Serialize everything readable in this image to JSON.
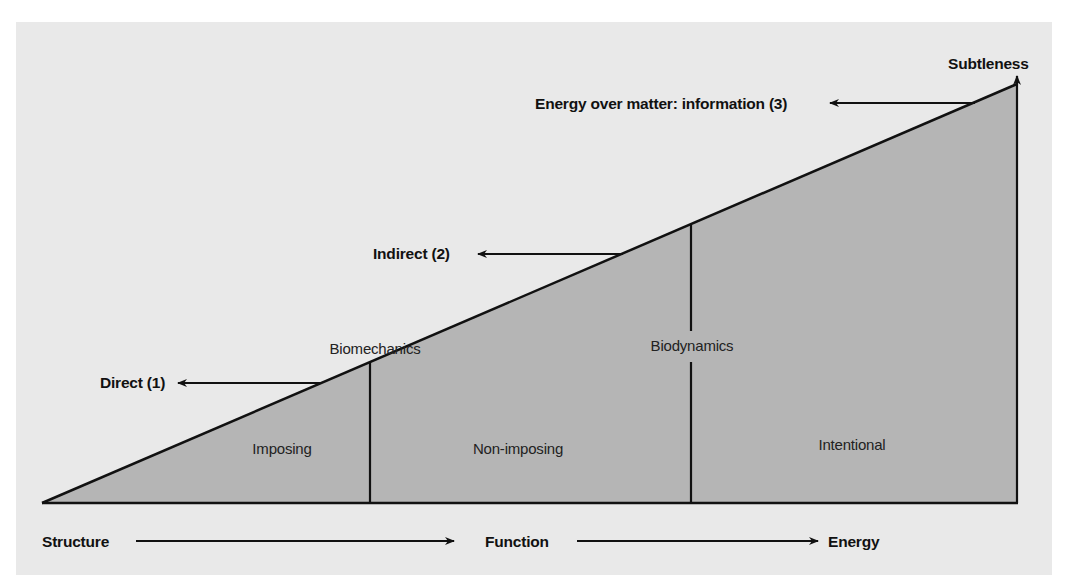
{
  "diagram": {
    "top_label": "Subtleness",
    "levels": [
      {
        "id": "direct",
        "label": "Direct (1)"
      },
      {
        "id": "indirect",
        "label": "Indirect (2)"
      },
      {
        "id": "information",
        "label": "Energy over matter: information (3)"
      }
    ],
    "dividers": [
      {
        "id": "biomechanics",
        "label": "Biomechanics"
      },
      {
        "id": "biodynamics",
        "label": "Biodynamics"
      }
    ],
    "regions": [
      {
        "id": "imposing",
        "label": "Imposing"
      },
      {
        "id": "non-imposing",
        "label": "Non-imposing"
      },
      {
        "id": "intentional",
        "label": "Intentional"
      }
    ],
    "axis": [
      {
        "id": "structure",
        "label": "Structure"
      },
      {
        "id": "function",
        "label": "Function"
      },
      {
        "id": "energy",
        "label": "Energy"
      }
    ],
    "colors": {
      "panel": "#e9e9e9",
      "triangle_fill": "#b5b5b5",
      "line": "#111111"
    }
  }
}
